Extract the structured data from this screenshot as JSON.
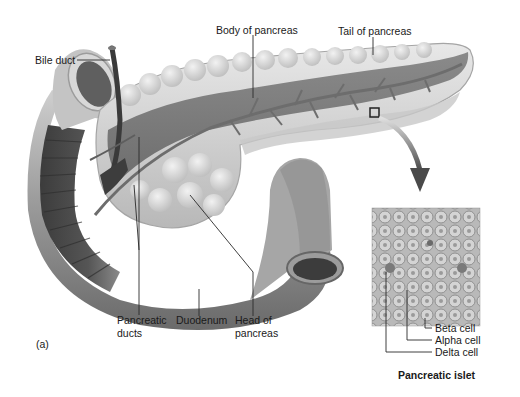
{
  "figure": {
    "panel_label": "(a)",
    "colors": {
      "background": "#ffffff",
      "tissue_light": "#d9d9d9",
      "tissue_mid": "#9a9a9a",
      "tissue_dark": "#5a5a5a",
      "leader_line": "#2a2a2a"
    }
  },
  "labels": {
    "bile_duct": "Bile duct",
    "body_of_pancreas": "Body of pancreas",
    "tail_of_pancreas": "Tail of pancreas",
    "pancreatic_ducts": "Pancreatic\nducts",
    "duodenum": "Duodenum",
    "head_of_pancreas": "Head of\npancreas"
  },
  "inset": {
    "title": "Pancreatic islet",
    "labels": {
      "beta_cell": "Beta cell",
      "alpha_cell": "Alpha cell",
      "delta_cell": "Delta cell"
    }
  }
}
